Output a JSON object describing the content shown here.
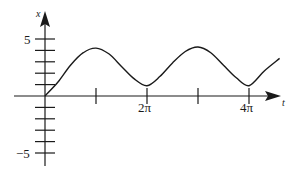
{
  "chart_data": {
    "type": "line",
    "title": "",
    "xlabel": "t",
    "ylabel": "x",
    "x_ticks": [
      {
        "value_pi": 1,
        "label": ""
      },
      {
        "value_pi": 2,
        "label": "2π"
      },
      {
        "value_pi": 3,
        "label": ""
      },
      {
        "value_pi": 4,
        "label": "4π"
      }
    ],
    "y_ticks": [
      -5,
      -4,
      -3,
      -2,
      -1,
      1,
      2,
      3,
      4,
      5
    ],
    "y_tick_labels": [
      {
        "value": 5,
        "label": "5"
      },
      {
        "value": -5,
        "label": "−5"
      }
    ],
    "xlim_pi": [
      -0.6,
      4.6
    ],
    "ylim": [
      -6.3,
      7.3
    ],
    "grid": false,
    "legend": null,
    "series": [
      {
        "name": "x(t)",
        "points_t_over_pi": [
          0,
          0.25,
          0.5,
          0.75,
          1.0,
          1.25,
          1.5,
          1.75,
          2.0,
          2.25,
          2.5,
          2.75,
          3.0,
          3.25,
          3.5,
          3.75,
          4.0,
          4.3,
          4.6
        ],
        "values": [
          0,
          1.2,
          2.7,
          3.8,
          4.2,
          3.7,
          2.6,
          1.5,
          0.9,
          1.7,
          2.9,
          3.9,
          4.3,
          3.8,
          2.7,
          1.6,
          0.9,
          2.2,
          3.3
        ]
      }
    ]
  },
  "labels": {
    "y_axis": "x",
    "x_axis": "t",
    "y_top": "5",
    "y_bottom": "−5",
    "x_2pi": "2π",
    "x_4pi": "4π"
  }
}
